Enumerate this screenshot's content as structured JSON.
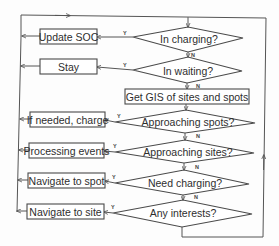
{
  "diagram": {
    "type": "flowchart",
    "decisions": [
      {
        "id": "d1",
        "label": "In charging?",
        "yes_action": "Update SOC",
        "yes_label": "Y",
        "no_label": "N"
      },
      {
        "id": "d2",
        "label": "In waiting?",
        "yes_action": "Stay",
        "yes_label": "Y",
        "no_label": "N"
      },
      {
        "id": "d3",
        "label": "Approaching spots?",
        "yes_action": "If needed, charge",
        "yes_label": "Y",
        "no_label": "N"
      },
      {
        "id": "d4",
        "label": "Approaching sites?",
        "yes_action": "Processing events",
        "yes_label": "Y",
        "no_label": "N"
      },
      {
        "id": "d5",
        "label": "Need charging?",
        "yes_action": "Navigate to spot",
        "yes_label": "Y",
        "no_label": "N"
      },
      {
        "id": "d6",
        "label": "Any interests?",
        "yes_action": "Navigate to site",
        "yes_label": "Y",
        "no_label": ""
      }
    ],
    "process": {
      "label": "Get GIS of sites and spots"
    },
    "actions": [
      {
        "label": "Update SOC"
      },
      {
        "label": "Stay"
      },
      {
        "label": "If needed, charge"
      },
      {
        "label": "Processing events"
      },
      {
        "label": "Navigate to spot"
      },
      {
        "label": "Navigate to site"
      }
    ],
    "edge_labels": {
      "yes": "Y",
      "no": "N"
    },
    "colors": {
      "line": "#555555",
      "stroke": "#4a4a4a",
      "text": "#2e2e2e",
      "background": "#fdfdfd"
    }
  }
}
